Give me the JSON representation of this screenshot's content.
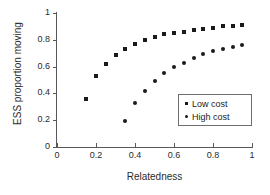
{
  "chart_data": {
    "type": "scatter",
    "title": "",
    "xlabel": "Relatedness",
    "ylabel": "ESS proportion moving",
    "xlim": [
      0,
      1
    ],
    "ylim": [
      0,
      1
    ],
    "xticks": [
      "0",
      "0.2",
      "0.4",
      "0.6",
      "0.8",
      "1"
    ],
    "xtick_values": [
      0,
      0.2,
      0.4,
      0.6,
      0.8,
      1
    ],
    "yticks": [
      "0",
      "0.2",
      "0.4",
      "0.6",
      "0.8",
      "1"
    ],
    "ytick_values": [
      0,
      0.2,
      0.4,
      0.6,
      0.8,
      1
    ],
    "grid": false,
    "legend_position": "lower-right",
    "series": [
      {
        "name": "Low cost",
        "marker": "square",
        "color": "#1a1a1a",
        "x": [
          0.15,
          0.2,
          0.25,
          0.3,
          0.35,
          0.4,
          0.45,
          0.5,
          0.55,
          0.6,
          0.65,
          0.7,
          0.75,
          0.8,
          0.85,
          0.9,
          0.95
        ],
        "y": [
          0.36,
          0.53,
          0.62,
          0.69,
          0.735,
          0.77,
          0.8,
          0.82,
          0.84,
          0.85,
          0.86,
          0.87,
          0.88,
          0.89,
          0.9,
          0.905,
          0.91
        ]
      },
      {
        "name": "High cost",
        "marker": "circle",
        "color": "#1a1a1a",
        "x": [
          0.35,
          0.4,
          0.45,
          0.5,
          0.55,
          0.6,
          0.65,
          0.7,
          0.75,
          0.8,
          0.85,
          0.9,
          0.95
        ],
        "y": [
          0.195,
          0.325,
          0.42,
          0.49,
          0.55,
          0.595,
          0.63,
          0.665,
          0.695,
          0.715,
          0.73,
          0.745,
          0.76
        ]
      }
    ]
  },
  "legend": {
    "entries": [
      {
        "label": "Low cost",
        "marker_name": "square-marker-icon"
      },
      {
        "label": "High cost",
        "marker_name": "circle-marker-icon"
      }
    ]
  }
}
